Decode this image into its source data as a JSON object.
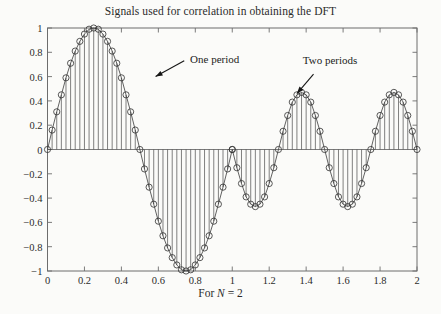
{
  "chart_data": {
    "type": "line",
    "title": "Signals used for correlation in obtaining the DFT",
    "xlabel": "For N = 2",
    "ylabel": "",
    "xlim": [
      0,
      2
    ],
    "ylim": [
      -1,
      1
    ],
    "grid": false,
    "legend": "none",
    "style": "stem-plot with circle markers and connecting line",
    "xticks": [
      0,
      0.2,
      0.4,
      0.6,
      0.8,
      1,
      1.2,
      1.4,
      1.6,
      1.8,
      2
    ],
    "xtick_labels": [
      "0",
      "0.2",
      "0.4",
      "0.6",
      "0.8",
      "1",
      "1.2",
      "1.4",
      "1.6",
      "1.8",
      "2"
    ],
    "yticks": [
      -1,
      -0.8,
      -0.6,
      -0.4,
      -0.2,
      0,
      0.2,
      0.4,
      0.6,
      0.8,
      1
    ],
    "ytick_labels": [
      "-1",
      "-0.8",
      "-0.6",
      "-0.4",
      "-0.2",
      "0",
      "0.2",
      "0.4",
      "0.6",
      "0.8",
      "1"
    ],
    "samples_per_unit": 40,
    "series": [
      {
        "name": "One period",
        "description": "sinusoid of amplitude 1 completing one cycle over x in [0,1]",
        "amplitude": 1.0,
        "cycles": 1,
        "x_range": [
          0,
          1
        ],
        "formula": "sin(2*pi*x)",
        "x": [
          0,
          0.025,
          0.05,
          0.075,
          0.1,
          0.125,
          0.15,
          0.175,
          0.2,
          0.225,
          0.25,
          0.275,
          0.3,
          0.325,
          0.35,
          0.375,
          0.4,
          0.425,
          0.45,
          0.475,
          0.5,
          0.525,
          0.55,
          0.575,
          0.6,
          0.625,
          0.65,
          0.675,
          0.7,
          0.725,
          0.75,
          0.775,
          0.8,
          0.825,
          0.85,
          0.875,
          0.9,
          0.925,
          0.95,
          0.975,
          1
        ],
        "y": [
          0,
          0.16,
          0.31,
          0.45,
          0.59,
          0.71,
          0.81,
          0.89,
          0.95,
          0.99,
          1.0,
          0.99,
          0.95,
          0.89,
          0.81,
          0.71,
          0.59,
          0.45,
          0.31,
          0.16,
          0,
          -0.16,
          -0.31,
          -0.45,
          -0.59,
          -0.71,
          -0.81,
          -0.89,
          -0.95,
          -0.99,
          -1.0,
          -0.99,
          -0.95,
          -0.89,
          -0.81,
          -0.71,
          -0.59,
          -0.45,
          -0.31,
          -0.16,
          0
        ]
      },
      {
        "name": "Two periods",
        "description": "sinusoid of amplitude ~0.47 completing two cycles over x in [1,2], drawn inverted-phase with negative lobes first",
        "amplitude": 0.47,
        "cycles": 2,
        "x_range": [
          1,
          2
        ],
        "formula": "-sin(4*pi*(x-1))",
        "x": [
          1,
          1.025,
          1.05,
          1.075,
          1.1,
          1.125,
          1.15,
          1.175,
          1.2,
          1.225,
          1.25,
          1.275,
          1.3,
          1.325,
          1.35,
          1.375,
          1.4,
          1.425,
          1.45,
          1.475,
          1.5,
          1.525,
          1.55,
          1.575,
          1.6,
          1.625,
          1.65,
          1.675,
          1.7,
          1.725,
          1.75,
          1.775,
          1.8,
          1.825,
          1.85,
          1.875,
          1.9,
          1.925,
          1.95,
          1.975,
          2
        ],
        "y": [
          0,
          -0.15,
          -0.28,
          -0.39,
          -0.45,
          -0.47,
          -0.45,
          -0.39,
          -0.28,
          -0.15,
          0,
          0.15,
          0.28,
          0.39,
          0.45,
          0.47,
          0.45,
          0.39,
          0.28,
          0.15,
          0,
          -0.15,
          -0.28,
          -0.39,
          -0.45,
          -0.47,
          -0.45,
          -0.39,
          -0.28,
          -0.15,
          0,
          0.15,
          0.28,
          0.39,
          0.45,
          0.47,
          0.45,
          0.39,
          0.28,
          0.15,
          0
        ]
      }
    ],
    "annotations": [
      {
        "text": "One period",
        "x": 0.75,
        "y": 0.73
      },
      {
        "text": "Two periods",
        "x": 1.36,
        "y": 0.72
      }
    ],
    "colors": {
      "curve": "#3a3a3a",
      "stem": "#4a4a4a",
      "marker": "#303030",
      "axis": "#6d6d6d",
      "background": "#fbfbf9",
      "text": "#1a1a1a"
    }
  }
}
